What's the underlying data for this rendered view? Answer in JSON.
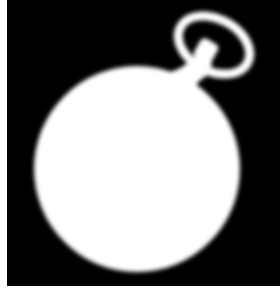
{
  "image": {
    "subject": "pocket-watch-silhouette",
    "description": "White silhouette of a pocket watch with bow ring on black background",
    "colors": {
      "background": "#000000",
      "foreground": "#ffffff",
      "page": "#ffffff"
    }
  }
}
